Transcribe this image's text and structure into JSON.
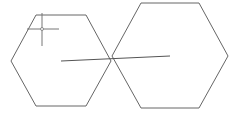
{
  "canvas": {
    "width": 241,
    "height": 117,
    "background": "#ffffff",
    "stroke": "#666666"
  },
  "shapes": {
    "left_hexagon": {
      "points": "36,15 86,15 111,61 86,106 36,106 11,61"
    },
    "right_hexagon": {
      "points": "141,3 199,3 228,56 199,108 141,108 112,56"
    },
    "line": {
      "x1": 61,
      "y1": 61,
      "x2": 170,
      "y2": 56
    },
    "crosshair": {
      "cx": 42,
      "cy": 29,
      "r": 1.5
    }
  }
}
